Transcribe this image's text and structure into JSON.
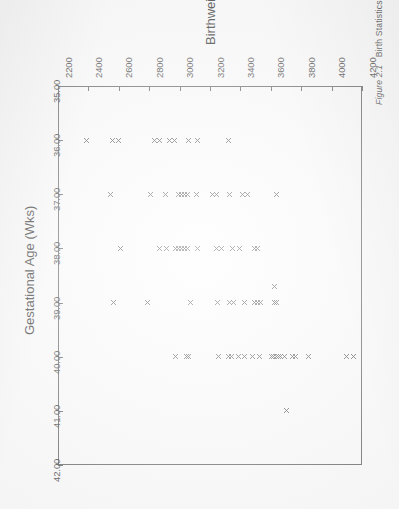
{
  "figure": {
    "caption_number": "Figure 2.1",
    "caption_text": "Birth Statistics for all Foresight pregnancies."
  },
  "chart_data": {
    "type": "scatter",
    "title": "",
    "xlabel": "Gestational Age (Wks)",
    "ylabel": "Birthweight (g)",
    "xlim": [
      35.0,
      42.0
    ],
    "ylim": [
      2200,
      4200
    ],
    "xticks": [
      "35.00",
      "36.00",
      "37.00",
      "38.00",
      "39.00",
      "40.00",
      "41.00",
      "42.00"
    ],
    "xtick_values": [
      35,
      36,
      37,
      38,
      39,
      40,
      41,
      42
    ],
    "yticks": [
      "2200",
      "2400",
      "2600",
      "2800",
      "3000",
      "3200",
      "3400",
      "3600",
      "3800",
      "4000",
      "4200"
    ],
    "ytick_values": [
      2200,
      2400,
      2600,
      2800,
      3000,
      3200,
      3400,
      3600,
      3800,
      4000,
      4200
    ],
    "grid": false,
    "legend": null,
    "marker": "x",
    "marker_color": "#4b4b4b",
    "rotation_deg": 90,
    "points": [
      [
        36.0,
        2390
      ],
      [
        36.0,
        2560
      ],
      [
        36.0,
        2600
      ],
      [
        36.0,
        2835
      ],
      [
        36.0,
        2865
      ],
      [
        36.0,
        2935
      ],
      [
        36.0,
        2965
      ],
      [
        36.0,
        3060
      ],
      [
        36.0,
        3115
      ],
      [
        36.0,
        3320
      ],
      [
        37.0,
        2545
      ],
      [
        37.0,
        2810
      ],
      [
        37.0,
        2910
      ],
      [
        37.0,
        2990
      ],
      [
        37.0,
        3010
      ],
      [
        37.0,
        3030
      ],
      [
        37.0,
        3050
      ],
      [
        37.0,
        3110
      ],
      [
        37.0,
        3215
      ],
      [
        37.0,
        3240
      ],
      [
        37.0,
        3330
      ],
      [
        37.0,
        3415
      ],
      [
        37.0,
        3445
      ],
      [
        37.0,
        3640
      ],
      [
        38.0,
        2610
      ],
      [
        38.0,
        2865
      ],
      [
        38.0,
        2915
      ],
      [
        38.0,
        2975
      ],
      [
        38.0,
        2995
      ],
      [
        38.0,
        3015
      ],
      [
        38.0,
        3035
      ],
      [
        38.0,
        3055
      ],
      [
        38.0,
        3120
      ],
      [
        38.0,
        3245
      ],
      [
        38.0,
        3275
      ],
      [
        38.0,
        3345
      ],
      [
        38.0,
        3395
      ],
      [
        38.0,
        3490
      ],
      [
        38.0,
        3510
      ],
      [
        38.7,
        3625
      ],
      [
        39.0,
        2565
      ],
      [
        39.0,
        2790
      ],
      [
        39.0,
        3070
      ],
      [
        39.0,
        3250
      ],
      [
        39.0,
        3330
      ],
      [
        39.0,
        3355
      ],
      [
        39.0,
        3430
      ],
      [
        39.0,
        3490
      ],
      [
        39.0,
        3510
      ],
      [
        39.0,
        3530
      ],
      [
        39.0,
        3625
      ],
      [
        39.0,
        3640
      ],
      [
        40.0,
        2975
      ],
      [
        40.0,
        3045
      ],
      [
        40.0,
        3060
      ],
      [
        40.0,
        3255
      ],
      [
        40.0,
        3320
      ],
      [
        40.0,
        3340
      ],
      [
        40.0,
        3385
      ],
      [
        40.0,
        3430
      ],
      [
        40.0,
        3480
      ],
      [
        40.0,
        3525
      ],
      [
        40.0,
        3605
      ],
      [
        40.0,
        3620
      ],
      [
        40.0,
        3635
      ],
      [
        40.0,
        3650
      ],
      [
        40.0,
        3665
      ],
      [
        40.0,
        3690
      ],
      [
        40.0,
        3745
      ],
      [
        40.0,
        3765
      ],
      [
        40.0,
        3850
      ],
      [
        40.0,
        4095
      ],
      [
        40.0,
        4145
      ],
      [
        41.0,
        3700
      ]
    ]
  }
}
